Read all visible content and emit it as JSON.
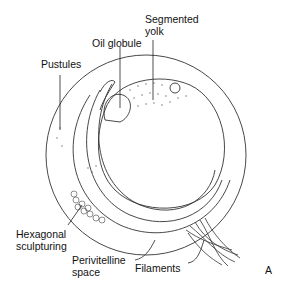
{
  "figure": {
    "panel_letter": "A",
    "labels": {
      "segmented_yolk": "Segmented\nyolk",
      "oil_globule": "Oil globule",
      "pustules": "Pustules",
      "hexagonal_sculpturing": "Hexagonal\nsculpturing",
      "perivitelline_space": "Perivitelline\nspace",
      "filaments": "Filaments"
    }
  }
}
